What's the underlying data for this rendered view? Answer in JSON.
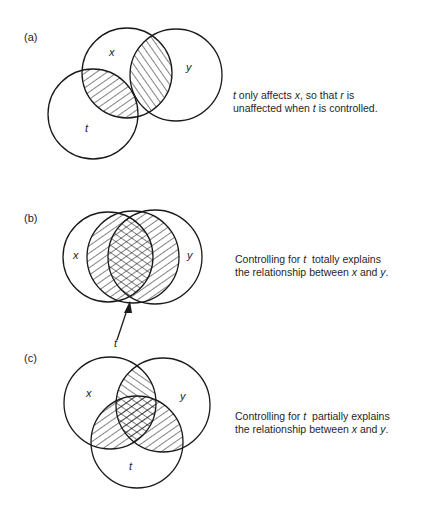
{
  "panels": [
    {
      "id": "a",
      "label": "(a)",
      "caption": {
        "line1": {
          "v1": "t",
          "text1": " only affects ",
          "v2": "x",
          "text2": ", so that ",
          "v3": "r",
          "text3": " is"
        },
        "line2": {
          "text1": "unaffected when ",
          "v1": "t",
          "text2": " is controlled."
        }
      },
      "circles": {
        "x": "x",
        "y": "y",
        "t": "t"
      }
    },
    {
      "id": "b",
      "label": "(b)",
      "caption": {
        "line1": {
          "text1": "Controlling for ",
          "v1": "t",
          "text2": "  totally explains"
        },
        "line2": {
          "text1": "the relationship between ",
          "v1": "x",
          "text2": " and ",
          "v2": "y",
          "text3": "."
        }
      },
      "circles": {
        "x": "x",
        "y": "y",
        "t": "t"
      }
    },
    {
      "id": "c",
      "label": "(c)",
      "caption": {
        "line1": {
          "text1": "Controlling for ",
          "v1": "t",
          "text2": "  partially explains"
        },
        "line2": {
          "text1": "the relationship between ",
          "v1": "x",
          "text2": " and ",
          "v2": "y",
          "text3": "."
        }
      },
      "circles": {
        "x": "x",
        "y": "y",
        "t": "t"
      }
    }
  ],
  "colors": {
    "stroke": "#1a1a1a",
    "background": "#ffffff"
  }
}
